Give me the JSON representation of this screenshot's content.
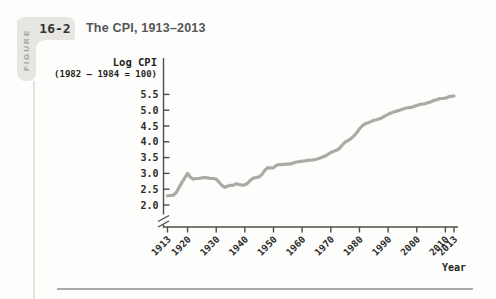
{
  "figure": {
    "label_vertical": "FIGURE",
    "number": "16-2",
    "title": "The CPI, 1913–2013"
  },
  "chart_data": {
    "type": "line",
    "title": "The CPI, 1913–2013",
    "ylabel_line1": "Log CPI",
    "ylabel_line2": "(1982 – 1984 = 100)",
    "xlabel": "Year",
    "x_ticks": [
      "1913",
      "1920",
      "1930",
      "1940",
      "1950",
      "1960",
      "1970",
      "1980",
      "1990",
      "2000",
      "2010",
      "2013"
    ],
    "y_ticks": [
      "2.0",
      "2.5",
      "3.0",
      "3.5",
      "4.0",
      "4.5",
      "5.0",
      "5.5"
    ],
    "xlim": [
      1913,
      2013
    ],
    "ylim": [
      2.0,
      5.5
    ],
    "axis_break": true,
    "grid": false,
    "legend": "none",
    "series": [
      {
        "name": "Log CPI",
        "x_start": 1913,
        "x_step": 1,
        "values": [
          2.29,
          2.3,
          2.31,
          2.39,
          2.55,
          2.71,
          2.85,
          3.0,
          2.88,
          2.82,
          2.84,
          2.84,
          2.86,
          2.87,
          2.86,
          2.84,
          2.84,
          2.82,
          2.72,
          2.62,
          2.56,
          2.6,
          2.62,
          2.63,
          2.67,
          2.65,
          2.63,
          2.64,
          2.69,
          2.79,
          2.85,
          2.87,
          2.89,
          2.97,
          3.1,
          3.18,
          3.17,
          3.18,
          3.26,
          3.28,
          3.28,
          3.29,
          3.29,
          3.3,
          3.34,
          3.36,
          3.37,
          3.39,
          3.4,
          3.41,
          3.42,
          3.43,
          3.45,
          3.48,
          3.51,
          3.55,
          3.6,
          3.66,
          3.7,
          3.73,
          3.79,
          3.9,
          3.99,
          4.04,
          4.1,
          4.18,
          4.28,
          4.41,
          4.51,
          4.57,
          4.6,
          4.64,
          4.68,
          4.7,
          4.73,
          4.77,
          4.82,
          4.87,
          4.91,
          4.94,
          4.97,
          5.0,
          5.03,
          5.06,
          5.08,
          5.09,
          5.12,
          5.15,
          5.18,
          5.19,
          5.21,
          5.24,
          5.27,
          5.31,
          5.33,
          5.37,
          5.37,
          5.38,
          5.42,
          5.44,
          5.45
        ]
      }
    ]
  },
  "colors": {
    "line": "#a8aba6",
    "axis": "#4c4c4a",
    "tick_label": "#2c2c2a",
    "tab_bg": "#e7e6e2",
    "tab_label": "#a3a19a",
    "tab_number": "#333331",
    "title_text": "#55565a",
    "divider": "#a9a9a7",
    "vert_rule": "#e4e3df",
    "background": "#fdfdfc"
  }
}
